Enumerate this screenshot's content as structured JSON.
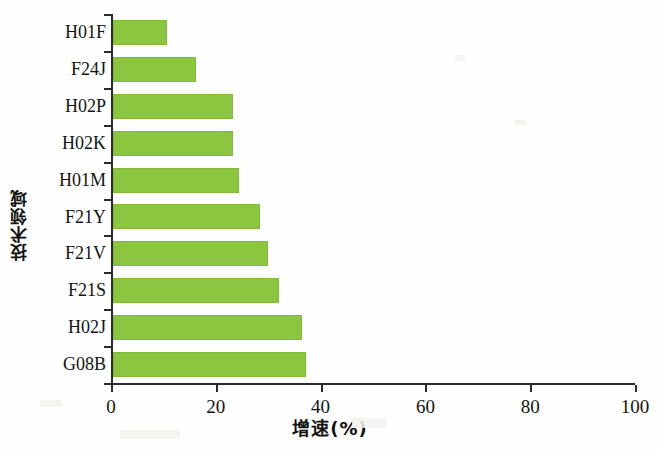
{
  "chart_data": {
    "type": "bar",
    "orientation": "horizontal",
    "title": "",
    "xlabel": "增速(%)",
    "ylabel": "技术领域",
    "categories": [
      "H01F",
      "F24J",
      "H02P",
      "H02K",
      "H01M",
      "F21Y",
      "F21V",
      "F21S",
      "H02J",
      "G08B"
    ],
    "values": [
      10.3,
      15.8,
      22.9,
      22.9,
      24.0,
      28.0,
      29.6,
      31.7,
      36.0,
      36.8
    ],
    "xlim": [
      0,
      100
    ],
    "xticks": [
      0,
      20,
      40,
      60,
      80,
      100
    ],
    "xticklabels": [
      "0",
      "20",
      "40",
      "60",
      "80",
      "100"
    ],
    "grid": false,
    "legend": null,
    "bar_color": "#8cc540",
    "axis_color": "#2b2b2b",
    "background": "#ffffff"
  }
}
